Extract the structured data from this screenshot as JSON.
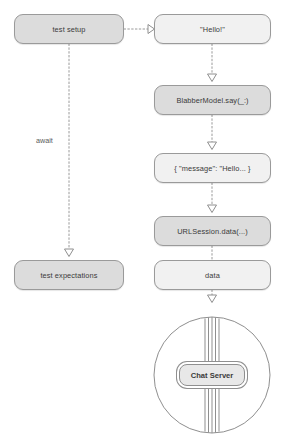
{
  "diagram": {
    "type": "flow-sequence",
    "title": "",
    "nodes": [
      {
        "id": "test-setup",
        "label": "test setup",
        "fill": "dark",
        "x": 14,
        "y": 14,
        "w": 110,
        "h": 30
      },
      {
        "id": "hello",
        "label": "\"Hello!\"",
        "fill": "light",
        "x": 154,
        "y": 14,
        "w": 117,
        "h": 30
      },
      {
        "id": "blabber-say",
        "label": "BlabberModel.say(_:)",
        "fill": "dark",
        "x": 154,
        "y": 85,
        "w": 117,
        "h": 30
      },
      {
        "id": "json-message",
        "label": "{ \"message\": \"Hello... }",
        "fill": "light",
        "x": 154,
        "y": 153,
        "w": 117,
        "h": 30
      },
      {
        "id": "urlsession-data",
        "label": "URLSession.data(...)",
        "fill": "dark",
        "x": 154,
        "y": 216,
        "w": 117,
        "h": 30
      },
      {
        "id": "data",
        "label": "data",
        "fill": "light",
        "x": 154,
        "y": 260,
        "w": 117,
        "h": 30
      },
      {
        "id": "test-expectations",
        "label": "test expectations",
        "fill": "dark",
        "x": 14,
        "y": 260,
        "w": 110,
        "h": 30
      }
    ],
    "edge_labels": [
      {
        "id": "await",
        "text": "await",
        "x": 36,
        "y": 136
      }
    ],
    "server": {
      "label": "Chat Server",
      "circle": {
        "cx": 212,
        "cy": 375,
        "r": 58
      },
      "box": {
        "x": 179,
        "y": 364,
        "w": 66,
        "h": 22
      },
      "cable_lines": 5
    },
    "colors": {
      "node_fill_dark": "#dcdcdc",
      "node_fill_light": "#f1f1f1",
      "node_stroke": "#9a9a9a",
      "edge_stroke": "#9a9a9a",
      "arrow_fill": "#ffffff",
      "text": "#3a3a3a",
      "label_text": "#5a5a5a",
      "background": "#ffffff"
    }
  }
}
